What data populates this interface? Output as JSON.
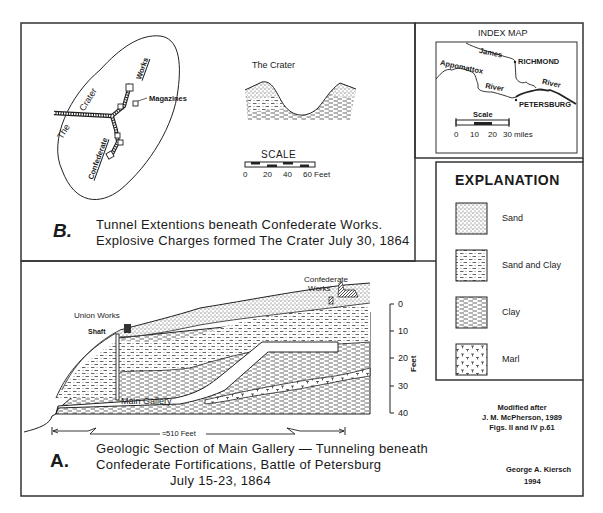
{
  "panel_b": {
    "letter": "B.",
    "caption_line1": "Tunnel Extentions beneath Confederate Works.",
    "caption_line2": "Explosive Charges formed The Crater July 30, 1864",
    "plan_labels": {
      "crater_the": "The",
      "crater_word": "Crater",
      "works": "Works",
      "confederate": "Confederate",
      "magazines": "Magazines"
    },
    "crater_profile_title": "The Crater",
    "scale": {
      "title": "SCALE",
      "ticks": [
        "0",
        "20",
        "40",
        "60 Feet"
      ]
    }
  },
  "index_map": {
    "title": "INDEX MAP",
    "labels": {
      "james": "James",
      "richmond": "RICHMOND",
      "appomattox": "Appomattox",
      "river1": "River",
      "river2": "River",
      "petersburg": "PETERSBURG"
    },
    "scale": {
      "title": "Scale",
      "ticks": [
        "0",
        "10",
        "20",
        "30 miles"
      ]
    }
  },
  "explanation": {
    "title": "EXPLANATION",
    "items": [
      {
        "label": "Sand",
        "pattern": "sand"
      },
      {
        "label": "Sand and Clay",
        "pattern": "sand-clay"
      },
      {
        "label": "Clay",
        "pattern": "clay"
      },
      {
        "label": "Marl",
        "pattern": "marl"
      }
    ]
  },
  "panel_a": {
    "letter": "A.",
    "caption_line1": "Geologic Section of Main Gallery — Tunneling beneath",
    "caption_line2": "Confederate Fortifications,  Battle of Petersburg",
    "caption_line3": "July 15-23,  1864",
    "labels": {
      "confederate_works_1": "Confederate",
      "confederate_works_2": "Works",
      "union_works": "Union Works",
      "shaft": "Shaft",
      "main_gallery": "Main Gallery",
      "length": "≈510 Feet"
    },
    "depth_axis": {
      "unit": "Feet",
      "ticks": [
        "0",
        "10",
        "20",
        "30",
        "40"
      ]
    }
  },
  "credits": {
    "modified_line1": "Modified after",
    "modified_line2": "J. M. McPherson, 1989",
    "modified_line3": "Figs. II and IV  p.61",
    "author": "George A. Kiersch",
    "year": "1994"
  }
}
